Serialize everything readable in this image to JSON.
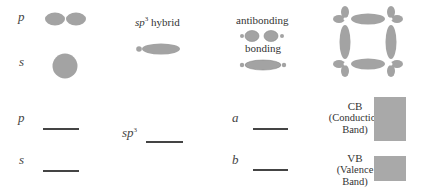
{
  "orbitals": {
    "p_label": "p",
    "s_label": "s",
    "hybrid_label_base": "sp",
    "hybrid_label_sup": "3",
    "hybrid_label_suffix": " hybrid",
    "antibonding_label": "antibonding",
    "bonding_label": "bonding"
  },
  "levels": {
    "p_label": "p",
    "s_label": "s",
    "sp3_base": "sp",
    "sp3_sup": "3",
    "a_label": "a",
    "b_label": "b"
  },
  "bands": {
    "cb_title": "CB",
    "cb_line1": "(Conduction",
    "cb_line2": "Band)",
    "vb_title": "VB",
    "vb_line1": "(Valence",
    "vb_line2": "Band)"
  },
  "colors": {
    "orbital_fill": "#a3a3a3",
    "band_fill": "#a9a9a9",
    "line": "#444444"
  }
}
